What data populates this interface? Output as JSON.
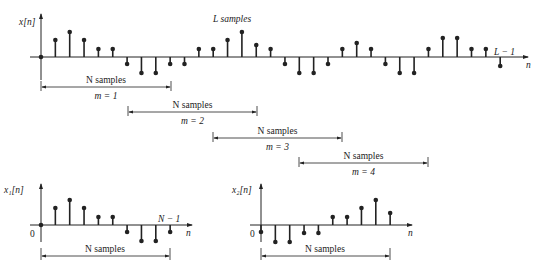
{
  "figure": {
    "top_plot": {
      "y_label": "x[n]",
      "x_label": "n",
      "title_label": "L samples",
      "end_label": "L − 1",
      "origin": {
        "x": 41,
        "y": 57
      },
      "spacing": 14.35,
      "values": [
        0,
        17,
        25,
        17,
        8,
        8,
        -7,
        -16,
        -16,
        -7,
        -7,
        8,
        8,
        17,
        25,
        12,
        8,
        -7,
        -16,
        -16,
        -7,
        8,
        14,
        8,
        -7,
        -16,
        -16,
        8,
        19,
        19,
        8,
        8,
        -9
      ]
    },
    "segments": [
      {
        "label": "N samples",
        "m_label": "m = 1",
        "x1": 41,
        "x2": 171,
        "y": 87
      },
      {
        "label": "N samples",
        "m_label": "m = 2",
        "x1": 128,
        "x2": 257,
        "y": 112
      },
      {
        "label": "N samples",
        "m_label": "m = 3",
        "x1": 213,
        "x2": 342,
        "y": 138
      },
      {
        "label": "N samples",
        "m_label": "m = 4",
        "x1": 299,
        "x2": 428,
        "y": 163
      }
    ],
    "x1_plot": {
      "y_label": "x₁[n]",
      "x_label": "n",
      "zero_label": "0",
      "end_label": "N − 1",
      "span_label": "N samples",
      "origin": {
        "x": 41,
        "y": 225
      },
      "spacing": 14.35,
      "values": [
        0,
        17,
        25,
        17,
        8,
        8,
        -7,
        -16,
        -16,
        -7
      ]
    },
    "x2_plot": {
      "y_label": "x₂[n]",
      "x_label": "n",
      "zero_label": "0",
      "span_label": "N samples",
      "origin": {
        "x": 261,
        "y": 225
      },
      "spacing": 14.35,
      "values": [
        -7,
        -17,
        -17,
        -8,
        -8,
        8,
        8,
        17,
        25,
        12
      ]
    }
  }
}
